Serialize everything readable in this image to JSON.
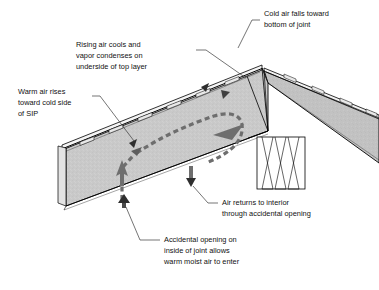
{
  "diagram": {
    "colors": {
      "panel_fill": "#c9c9c9",
      "panel_fill_dark": "#bdbdbd",
      "panel_edge": "#000000",
      "airflow_arrow": "#6e6e6e",
      "small_arrow": "#4a4a4a",
      "leader_line": "#3a3a3a",
      "text": "#111111",
      "background": "#ffffff"
    },
    "labels": [
      {
        "id": "cold-air-falls",
        "lines": [
          "Cold air falls toward",
          "bottom of joint"
        ]
      },
      {
        "id": "rising-air-cools",
        "lines": [
          "Rising air cools and",
          "vapor condenses on",
          "underside of top layer"
        ]
      },
      {
        "id": "warm-air-rises",
        "lines": [
          "Warm air rises",
          "toward cold side",
          "of SIP"
        ]
      },
      {
        "id": "air-returns",
        "lines": [
          "Air returns to interior",
          "through accidental opening"
        ]
      },
      {
        "id": "accidental-opening",
        "lines": [
          "Accidental opening on",
          "inside of joint allows",
          "warm moist air to enter"
        ]
      }
    ],
    "elements": {
      "left_panel": "left SIP roof panel",
      "right_panel": "right SIP roof panel",
      "ridge_joint": "ridge joint between panels",
      "ridge_beam": "ridge beam with zigzag hatching",
      "convection_loop": "dashed convection air loop",
      "up_arrow": "warm air rising arrow",
      "down_arrow": "cold air falling arrow"
    }
  }
}
